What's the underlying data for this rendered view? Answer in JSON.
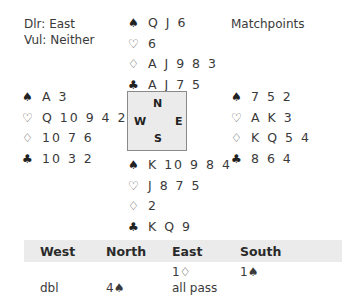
{
  "info": {
    "dealer": "Dlr: East",
    "vulnerability": "Vul: Neither",
    "scoring": "Matchpoints"
  },
  "suit_icons": {
    "spades": "♠",
    "hearts": "♡",
    "diamonds": "♢",
    "clubs": "♣"
  },
  "hands": {
    "north": {
      "spades": "Q J 6",
      "hearts": "6",
      "diamonds": "A J 9 8 3",
      "clubs": "A J 7 5"
    },
    "west": {
      "spades": "A 3",
      "hearts": "Q 10 9 4 2",
      "diamonds": "10 7 6",
      "clubs": "10 3 2"
    },
    "east": {
      "spades": "7 5 2",
      "hearts": "A K 3",
      "diamonds": "K Q 5 4",
      "clubs": "8 6 4"
    },
    "south": {
      "spades": "K 10 9 8 4",
      "hearts": "J 8 7 5",
      "diamonds": "2",
      "clubs": "K Q 9"
    }
  },
  "compass": {
    "north": "N",
    "west": "W",
    "east": "E",
    "south": "S"
  },
  "auction": {
    "headers": [
      "West",
      "North",
      "East",
      "South"
    ],
    "rows": [
      [
        "",
        "",
        "1♢",
        "1♠"
      ],
      [
        "dbl",
        "4♠",
        "all pass",
        ""
      ]
    ]
  }
}
